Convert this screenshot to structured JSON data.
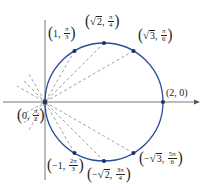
{
  "colors": {
    "circle": "#2a4d9b",
    "axes": "#555555",
    "dashed": "#777777",
    "points": "#1a2f6e",
    "text": "#222222"
  },
  "geometry": {
    "origin_px": [
      45,
      102
    ],
    "circle_center_px": [
      104,
      102
    ],
    "circle_radius_px": 59,
    "unit_px": 59
  },
  "points": [
    {
      "id": "p-1-pi3",
      "r": "1",
      "theta": "π/3",
      "label_r": "1",
      "label_num": "π",
      "label_den": "3",
      "sqrt": false,
      "neg": false,
      "px": [
        74.5,
        50.9
      ]
    },
    {
      "id": "p-sqrt2-pi4",
      "r": "√2",
      "theta": "π/4",
      "label_r": "2",
      "label_num": "π",
      "label_den": "4",
      "sqrt": true,
      "neg": false,
      "px": [
        104,
        43
      ]
    },
    {
      "id": "p-sqrt3-pi6",
      "r": "√3",
      "theta": "π/6",
      "label_r": "3",
      "label_num": "π",
      "label_den": "6",
      "sqrt": true,
      "neg": false,
      "px": [
        133.5,
        50.9
      ]
    },
    {
      "id": "p-2-0",
      "r": "2",
      "theta": "0",
      "label": "(2, 0)",
      "px": [
        163,
        102
      ]
    },
    {
      "id": "p-0-pi2",
      "r": "0",
      "theta": "π/2",
      "label_r": "0",
      "label_num": "π",
      "label_den": "2",
      "sqrt": false,
      "neg": false,
      "px": [
        45,
        102
      ]
    },
    {
      "id": "p-neg1-2pi3",
      "r": "−1",
      "theta": "2π/3",
      "label_r": "−1",
      "label_num": "2π",
      "label_den": "3",
      "sqrt": false,
      "neg": true,
      "px": [
        74.5,
        153.1
      ]
    },
    {
      "id": "p-negsqrt2-3pi4",
      "r": "−√2",
      "theta": "3π/4",
      "label_r": "2",
      "label_num": "3π",
      "label_den": "4",
      "sqrt": true,
      "neg": true,
      "px": [
        104,
        161
      ]
    },
    {
      "id": "p-negsqrt3-5pi6",
      "r": "−√3",
      "theta": "5π/6",
      "label_r": "3",
      "label_num": "5π",
      "label_den": "6",
      "sqrt": true,
      "neg": true,
      "px": [
        133.5,
        153.1
      ]
    }
  ],
  "labels": {
    "l1": {
      "open": "(",
      "r": "1",
      "comma": ",",
      "num": "π",
      "den": "3",
      "close": ")"
    },
    "l2": {
      "open": "(",
      "rad": "√",
      "r": "2",
      "comma": ",",
      "num": "π",
      "den": "4",
      "close": ")"
    },
    "l3": {
      "open": "(",
      "rad": "√",
      "r": "3",
      "comma": ",",
      "num": "π",
      "den": "6",
      "close": ")"
    },
    "l4": {
      "text": "(2, 0)"
    },
    "l5": {
      "open": "(",
      "r": "0",
      "comma": ",",
      "num": "π",
      "den": "2",
      "close": ")"
    },
    "l6": {
      "open": "(",
      "r": "−1",
      "comma": ",",
      "num": "2π",
      "den": "3",
      "close": ")"
    },
    "l7": {
      "open": "(",
      "neg": "−",
      "rad": "√",
      "r": "2",
      "comma": ",",
      "num": "3π",
      "den": "4",
      "close": ")"
    },
    "l8": {
      "open": "(",
      "neg": "−",
      "rad": "√",
      "r": "3",
      "comma": ",",
      "num": "5π",
      "den": "6",
      "close": ")"
    }
  }
}
